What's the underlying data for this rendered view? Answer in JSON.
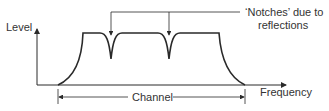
{
  "diagram": {
    "y_axis_label": "Level",
    "x_axis_label": "Frequency",
    "channel_label": "Channel",
    "annotation_line1": "‘Notches’ due to",
    "annotation_line2": "reflections",
    "colors": {
      "line": "#2a2a2a",
      "text": "#333333"
    }
  }
}
